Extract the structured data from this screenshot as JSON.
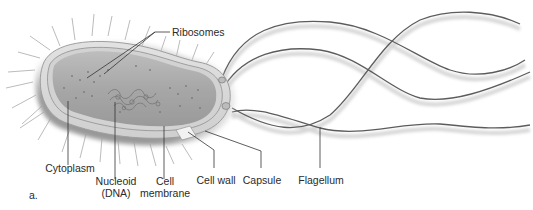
{
  "figure": {
    "panel_letter": "a.",
    "labels": {
      "ribosomes": "Ribosomes",
      "cytoplasm": "Cytoplasm",
      "nucleoid_line1": "Nucleoid",
      "nucleoid_line2": "(DNA)",
      "cell_membrane_line1": "Cell",
      "cell_membrane_line2": "membrane",
      "cell_wall": "Cell wall",
      "capsule": "Capsule",
      "flagellum": "Flagellum"
    },
    "colors": {
      "background": "#ffffff",
      "cell_fill": "#a9a9a9",
      "cell_inner": "#c4c4c4",
      "membrane": "#d8d8d8",
      "capsule_shadow": "#6e6e6e",
      "flagella": "#5a5a5a",
      "leader_lines": "#333333",
      "text": "#2b2b2b"
    }
  }
}
